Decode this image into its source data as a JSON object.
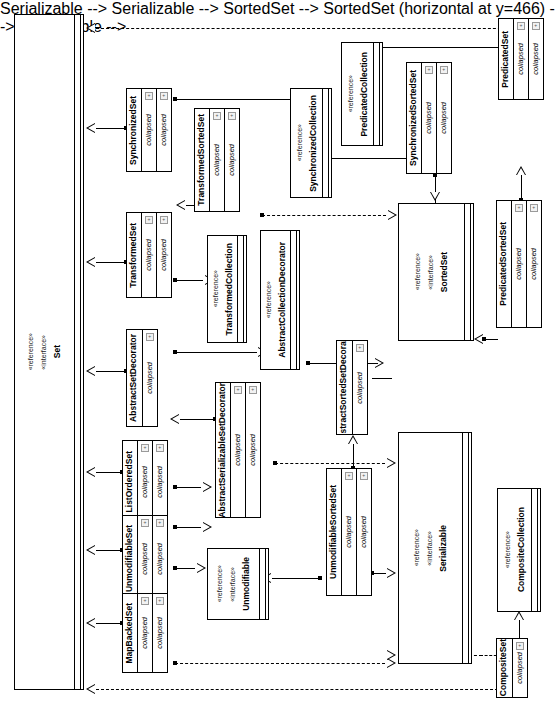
{
  "diagram": {
    "stereotype_reference": "«reference»",
    "stereotype_interface": "«interface»",
    "compartment_label": "collapsed",
    "visibility_marker": "+",
    "line_color": "#000000",
    "fill_color": "#ffffff"
  },
  "nodes": {
    "set": {
      "name": "Set",
      "stereotypes": [
        "«reference»",
        "«interface»"
      ],
      "kind": "interface"
    },
    "sorted_set": {
      "name": "SortedSet",
      "stereotypes": [
        "«reference»",
        "«interface»"
      ],
      "kind": "interface"
    },
    "serializable": {
      "name": "Serializable",
      "stereotypes": [
        "«reference»",
        "«interface»"
      ],
      "kind": "interface"
    },
    "unmodifiable": {
      "name": "Unmodifiable",
      "stereotypes": [
        "«reference»",
        "«interface»"
      ],
      "kind": "interface"
    },
    "synchronized_collection": {
      "name": "SynchronizedCollection",
      "stereotypes": [
        "«reference»"
      ],
      "kind": "reference"
    },
    "predicated_collection": {
      "name": "PredicatedCollection",
      "stereotypes": [
        "«reference»"
      ],
      "kind": "reference"
    },
    "transformed_collection": {
      "name": "TransformedCollection",
      "stereotypes": [
        "«reference»"
      ],
      "kind": "reference"
    },
    "abstract_collection_decorator": {
      "name": "AbstractCollectionDecorator",
      "stereotypes": [
        "«reference»"
      ],
      "kind": "reference"
    },
    "composite_collection": {
      "name": "CompositeCollection",
      "stereotypes": [
        "«reference»"
      ],
      "kind": "reference"
    },
    "synchronized_set": {
      "name": "SynchronizedSet",
      "compartments": [
        "collapsed",
        "collapsed"
      ]
    },
    "synchronized_sorted_set": {
      "name": "SynchronizedSortedSet",
      "compartments": [
        "collapsed",
        "collapsed"
      ]
    },
    "transformed_set": {
      "name": "TransformedSet",
      "compartments": [
        "collapsed",
        "collapsed"
      ]
    },
    "transformed_sorted_set": {
      "name": "TransformedSortedSet",
      "compartments": [
        "collapsed",
        "collapsed"
      ]
    },
    "predicated_set": {
      "name": "PredicatedSet",
      "compartments": [
        "collapsed",
        "collapsed"
      ]
    },
    "predicated_sorted_set": {
      "name": "PredicatedSortedSet",
      "compartments": [
        "collapsed",
        "collapsed"
      ]
    },
    "abstract_set_decorator": {
      "name": "AbstractSetDecorator",
      "compartments": [
        "collapsed"
      ]
    },
    "abstract_sorted_set_decorator": {
      "name": "AbstractSortedSetDecorator",
      "compartments": [
        "collapsed"
      ]
    },
    "abstract_serializable_set_decorator": {
      "name": "AbstractSerializableSetDecorator",
      "compartments": [
        "collapsed",
        "collapsed"
      ]
    },
    "list_ordered_set": {
      "name": "ListOrderedSet",
      "compartments": [
        "collapsed",
        "collapsed"
      ]
    },
    "unmodifiable_set": {
      "name": "UnmodifiableSet",
      "compartments": [
        "collapsed",
        "collapsed"
      ]
    },
    "unmodifiable_sorted_set": {
      "name": "UnmodifiableSortedSet",
      "compartments": [
        "collapsed",
        "collapsed"
      ]
    },
    "map_backed_set": {
      "name": "MapBackedSet",
      "compartments": [
        "collapsed",
        "collapsed"
      ]
    },
    "composite_set": {
      "name": "CompositeSet",
      "compartments": [
        "collapsed"
      ]
    }
  }
}
